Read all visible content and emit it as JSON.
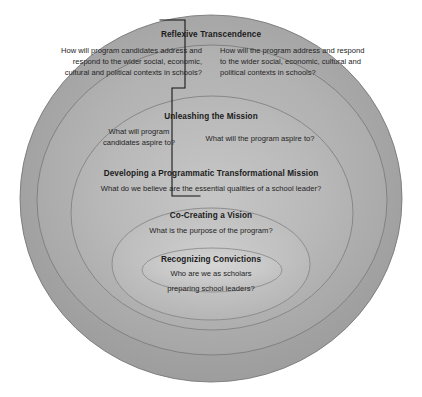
{
  "diagram": {
    "type": "concentric-nested-ellipses",
    "background_color": "#ffffff",
    "ring_fill_outer": "#a8a8a8",
    "ring_fill_inner": "#c9c9c9",
    "ring_stroke_color": "#6e6e6e",
    "divider_color": "#111111",
    "levels": [
      {
        "id": "reflexive-transcendence",
        "title": "Reflexive Transcendence",
        "question_candidates": "How will program candidates address and respond to the wider social, economic, cultural and political contexts in schools?",
        "question_program": "How will the program address and respond to the wider social, economic, cultural and political contexts in schools?"
      },
      {
        "id": "unleashing-the-mission",
        "title": "Unleashing the Mission",
        "question_candidates": "What will program candidates aspire to?",
        "question_program": "What will the program aspire to?"
      },
      {
        "id": "developing-a-programmatic-transformational-mission",
        "title": "Developing a Programmatic Transformational Mission",
        "question": "What do we believe are the essential qualities of a school leader?"
      },
      {
        "id": "co-creating-a-vision",
        "title": "Co-Creating a Vision",
        "question": "What is the purpose of the program?"
      },
      {
        "id": "recognizing-convictions",
        "title": "Recognizing Convictions",
        "question_line1": "Who are we as scholars",
        "question_line2": "preparing school leaders?"
      }
    ]
  }
}
